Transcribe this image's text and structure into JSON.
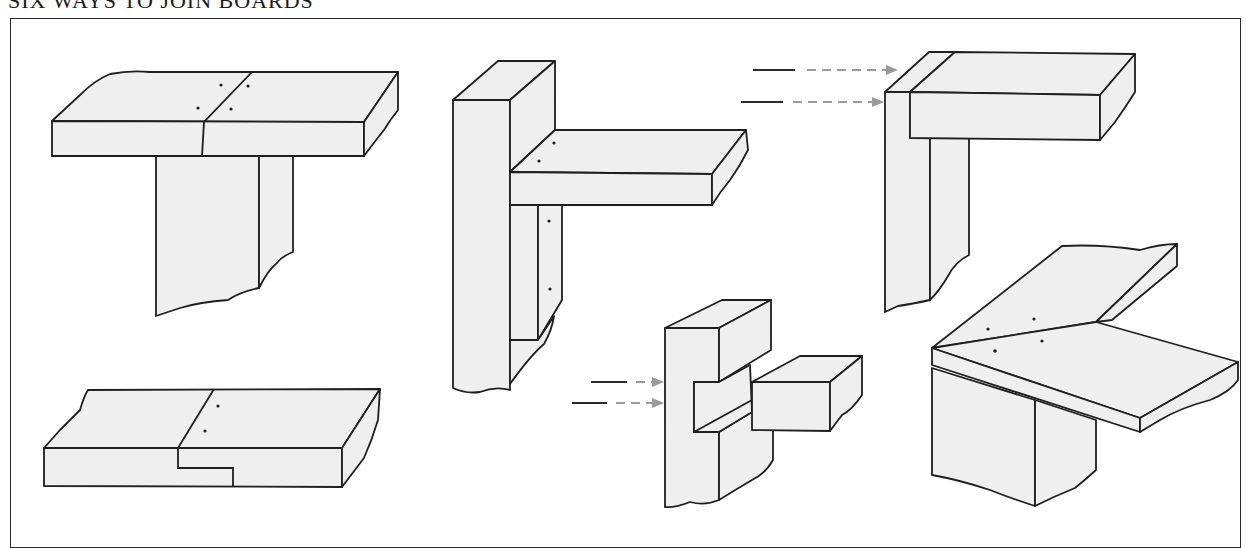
{
  "title": "SIX WAYS TO JOIN BOARDS",
  "colors": {
    "line": "#1f1f1f",
    "wood_fill": "#efefef",
    "arrow": "#9a9a9a",
    "background": "#ffffff"
  },
  "joints": [
    {
      "id": "butt-tee",
      "description": "Two boards butted end to end on top of an upright board, nailed with four nails",
      "nails": 4
    },
    {
      "id": "rabbet-splice",
      "description": "Lap/rabbet splice joint of two boards end to end, two nails",
      "nails": 2
    },
    {
      "id": "cleat-brace",
      "description": "Horizontal board against upright post, supported by a nailed cleat below",
      "nails": 4
    },
    {
      "id": "corner-butt",
      "description": "Corner butt joint with nails driven through the side (arrows)",
      "nails": 2
    },
    {
      "id": "dado-notch",
      "description": "Notched (dado) joint with a crosspiece fitted into an upright, nailed through side (arrows)",
      "nails": 2
    },
    {
      "id": "miter-joint",
      "description": "Mitered corner joint over an upright, four nails",
      "nails": 4
    }
  ]
}
